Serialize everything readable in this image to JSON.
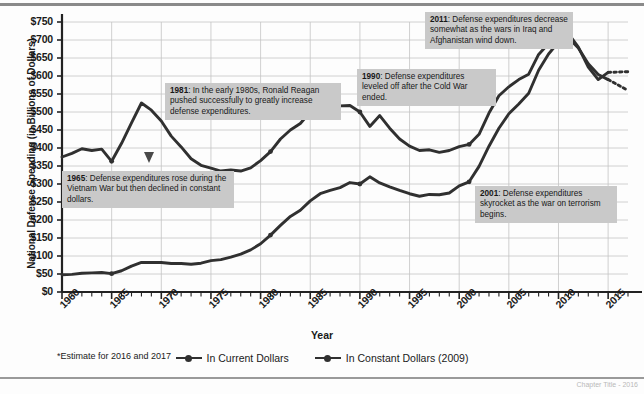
{
  "figure": {
    "ylabel": "National Defense Spending (in Billions of Dollars)",
    "xlabel": "Year",
    "estimate_note": "*Estimate for 2016 and 2017",
    "source_note": "Chapter Title - 2016"
  },
  "legend": {
    "items": [
      {
        "label": "In Current Dollars",
        "color": "#303030"
      },
      {
        "label": "In Constant Dollars (2009)",
        "color": "#303030"
      }
    ]
  },
  "callouts": [
    {
      "year": "1965",
      "text": ": Defense expenditures rose during the Vietnam War but then declined in constant dollars."
    },
    {
      "year": "1981",
      "text": ": In the early 1980s, Ronald Reagan pushed successfully to greatly increase defense expenditures."
    },
    {
      "year": "1990",
      "text": ": Defense expenditures leveled off after the Cold War ended."
    },
    {
      "year": "2011",
      "text": ": Defense expenditures decrease somewhat as the wars in Iraq and Afghanistan wind down."
    },
    {
      "year": "2001",
      "text": ": Defense expenditures skyrocket as the war on terrorism begins."
    }
  ],
  "chart_data": {
    "type": "line",
    "title": "",
    "xlabel": "Year",
    "ylabel": "National Defense Spending (in Billions of Dollars)",
    "xlim": [
      1960,
      2017
    ],
    "ylim": [
      0,
      750
    ],
    "ytick_labels": [
      "$0",
      "$50",
      "$100",
      "$150",
      "$200",
      "$250",
      "$300",
      "$350",
      "$400",
      "$450",
      "$500",
      "$550",
      "$600",
      "$650",
      "$700",
      "$750"
    ],
    "ytick_values": [
      0,
      50,
      100,
      150,
      200,
      250,
      300,
      350,
      400,
      450,
      500,
      550,
      600,
      650,
      700,
      750
    ],
    "xtick_labels": [
      "1960",
      "1965",
      "1970",
      "1975",
      "1980",
      "1985",
      "1990",
      "1995",
      "2000",
      "2005",
      "2010",
      "2015"
    ],
    "xtick_values": [
      1960,
      1965,
      1970,
      1975,
      1980,
      1985,
      1990,
      1995,
      2000,
      2005,
      2010,
      2015
    ],
    "minor_xtick_interval": 1,
    "grid": true,
    "legend_position": "below",
    "x": [
      1960,
      1961,
      1962,
      1963,
      1964,
      1965,
      1966,
      1967,
      1968,
      1969,
      1970,
      1971,
      1972,
      1973,
      1974,
      1975,
      1976,
      1977,
      1978,
      1979,
      1980,
      1981,
      1982,
      1983,
      1984,
      1985,
      1986,
      1987,
      1988,
      1989,
      1990,
      1991,
      1992,
      1993,
      1994,
      1995,
      1996,
      1997,
      1998,
      1999,
      2000,
      2001,
      2002,
      2003,
      2004,
      2005,
      2006,
      2007,
      2008,
      2009,
      2010,
      2011,
      2012,
      2013,
      2014,
      2015
    ],
    "x_estimate": [
      2016,
      2017
    ],
    "series": [
      {
        "name": "In Current Dollars",
        "values": [
          48,
          49,
          52,
          53,
          54,
          51,
          59,
          72,
          82,
          82,
          82,
          79,
          79,
          77,
          80,
          87,
          90,
          97,
          105,
          117,
          134,
          158,
          185,
          210,
          227,
          253,
          273,
          282,
          290,
          304,
          300,
          320,
          303,
          292,
          282,
          273,
          266,
          271,
          270,
          275,
          295,
          306,
          349,
          405,
          455,
          495,
          522,
          552,
          616,
          661,
          694,
          706,
          678,
          634,
          604,
          590
        ],
        "values_estimate": [
          560,
          560
        ],
        "color": "#303030"
      },
      {
        "name": "In Constant Dollars (2009)",
        "values": [
          375,
          385,
          398,
          393,
          397,
          363,
          413,
          470,
          525,
          505,
          475,
          433,
          403,
          370,
          352,
          344,
          336,
          339,
          336,
          345,
          365,
          390,
          425,
          450,
          468,
          500,
          525,
          524,
          517,
          518,
          500,
          460,
          490,
          455,
          425,
          405,
          393,
          395,
          388,
          393,
          404,
          410,
          438,
          497,
          545,
          570,
          590,
          605,
          660,
          690,
          725,
          718,
          680,
          625,
          590,
          610
        ],
        "values_estimate": [
          612,
          612
        ],
        "color": "#303030"
      }
    ]
  }
}
